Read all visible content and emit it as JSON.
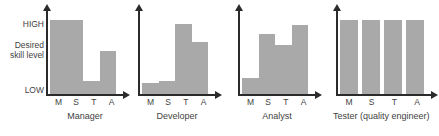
{
  "chart_data": {
    "type": "bar",
    "title": "",
    "xlabel": "",
    "ylabel": "",
    "ylim": [
      0,
      100
    ],
    "grid": false,
    "legend": "none",
    "y_axis_ticks": [
      {
        "label": "HIGH",
        "value": 95
      },
      {
        "label": "Desired skill level",
        "value": 55
      },
      {
        "label": "LOW",
        "value": 8
      }
    ],
    "y_tick_high": "HIGH",
    "y_tick_mid_line1": "Desired",
    "y_tick_mid_line2": "skill level",
    "y_tick_low": "LOW",
    "categories": [
      "M",
      "S",
      "T",
      "A"
    ],
    "panels": [
      {
        "title": "Manager",
        "categories": [
          "M",
          "S",
          "T",
          "A"
        ],
        "values": [
          88,
          88,
          16,
          52
        ]
      },
      {
        "title": "Developer",
        "categories": [
          "M",
          "S",
          "T",
          "A"
        ],
        "values": [
          14,
          16,
          84,
          62
        ]
      },
      {
        "title": "Analyst",
        "categories": [
          "M",
          "S",
          "T",
          "A"
        ],
        "values": [
          20,
          72,
          58,
          82
        ]
      },
      {
        "title": "Tester (quality engineer)",
        "categories": [
          "M",
          "S",
          "T",
          "A"
        ],
        "values": [
          88,
          88,
          88,
          88
        ]
      }
    ],
    "colors": {
      "bar": "#a9a9a9",
      "axis": "#2b2b2b",
      "text": "#3f3f3f",
      "background": "#ffffff"
    }
  }
}
